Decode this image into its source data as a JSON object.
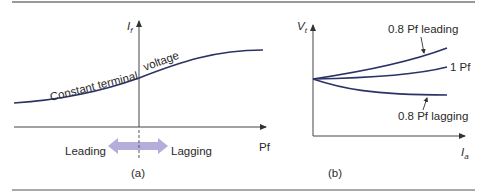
{
  "figure": {
    "panel_a": {
      "caption": "(a)",
      "y_axis_label": "I",
      "y_axis_subscript": "f",
      "x_axis_label": "Pf",
      "curve_label_left": "Constant terminal",
      "curve_label_right": "voltage",
      "arrow_left_label": "Leading",
      "arrow_right_label": "Lagging",
      "arrow_color": "#b7addb"
    },
    "panel_b": {
      "caption": "(b)",
      "y_axis_label": "V",
      "y_axis_subscript": "t",
      "x_axis_label": "I",
      "x_axis_subscript": "a",
      "curves": [
        {
          "label": "0.8 Pf leading"
        },
        {
          "label": "1 Pf"
        },
        {
          "label": "0.8 Pf lagging"
        }
      ]
    },
    "curve_color": "#2b3266",
    "axis_color": "#444444",
    "rule_color": "#555555"
  }
}
